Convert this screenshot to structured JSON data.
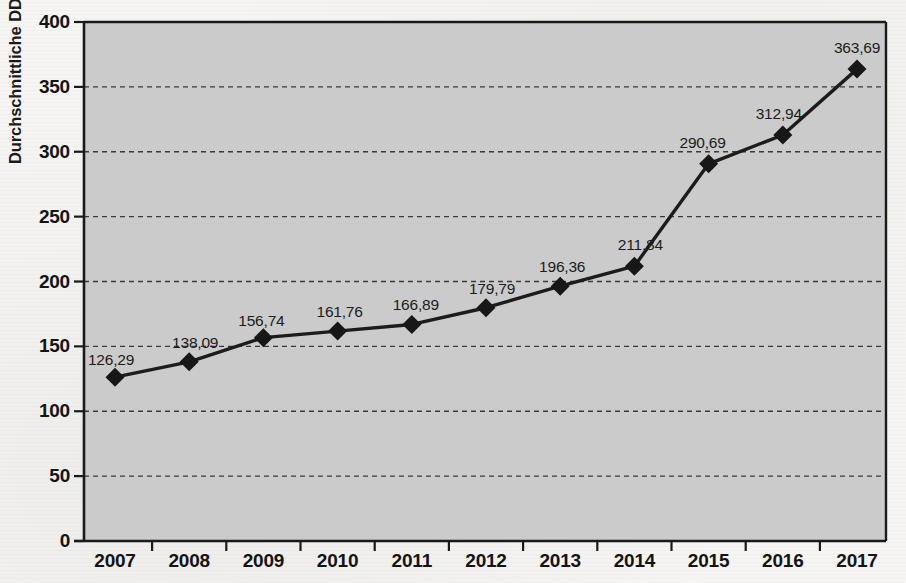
{
  "chart_data": {
    "type": "line",
    "title": "",
    "subtitle": "",
    "xlabel": "",
    "ylabel": "Durchschnittliche DDD-Kosten in €",
    "categories": [
      "2007",
      "2008",
      "2009",
      "2010",
      "2011",
      "2012",
      "2013",
      "2014",
      "2015",
      "2016",
      "2017"
    ],
    "values": [
      126.29,
      138.09,
      156.74,
      161.76,
      166.89,
      179.79,
      196.36,
      211.84,
      290.69,
      312.94,
      363.69
    ],
    "value_labels": [
      "126,29",
      "138,09",
      "156,74",
      "161,76",
      "166,89",
      "179,79",
      "196,36",
      "211,84",
      "290,69",
      "312,94",
      "363,69"
    ],
    "ylim": [
      0,
      400
    ],
    "y_ticks": [
      0,
      50,
      100,
      150,
      200,
      250,
      300,
      350,
      400
    ],
    "y_tick_labels": [
      "0",
      "50",
      "100",
      "150",
      "200",
      "250",
      "300",
      "350",
      "400"
    ],
    "grid": "horizontal-dashed",
    "legend": "none",
    "series": [
      {
        "name": "Durchschnittliche DDD-Kosten in €",
        "marker": "diamond",
        "values": [
          126.29,
          138.09,
          156.74,
          161.76,
          166.89,
          179.79,
          196.36,
          211.84,
          290.69,
          312.94,
          363.69
        ]
      }
    ],
    "colors": {
      "plot_background": "#c9c9c9",
      "page_background": "#f6f5f3",
      "line": "#1c1c1c",
      "marker": "#171717",
      "gridline": "#3a3a3a",
      "axis": "#1a1a1a",
      "text": "#141414"
    }
  }
}
